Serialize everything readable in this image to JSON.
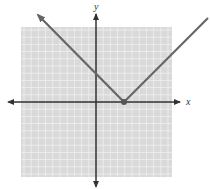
{
  "chart_data": {
    "type": "line",
    "title": "",
    "xlabel": "x",
    "ylabel": "y",
    "function": "y = |x - 4|",
    "vertex": {
      "x": 4,
      "y": 0
    },
    "series": [
      {
        "name": "y = |x - 4|",
        "x": [
          -6.5,
          4,
          14
        ],
        "y": [
          10.5,
          0,
          10
        ]
      }
    ],
    "xlim": [
      -10,
      10
    ],
    "ylim": [
      -10,
      10
    ],
    "grid": true,
    "grid_step": 1
  },
  "labels": {
    "x_axis": "x",
    "y_axis": "y"
  },
  "colors": {
    "grid_bg": "#d9d9d9",
    "grid_line": "#f2f2f2",
    "axis": "#333333",
    "curve": "#666666",
    "vertex": "#555555"
  }
}
